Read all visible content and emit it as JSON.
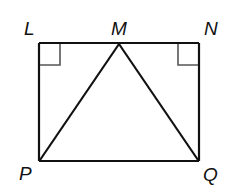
{
  "diagram": {
    "type": "geometry",
    "points": {
      "L": {
        "label": "L",
        "x": 39,
        "y": 43
      },
      "M": {
        "label": "M",
        "x": 119,
        "y": 43
      },
      "N": {
        "label": "N",
        "x": 199,
        "y": 43
      },
      "P": {
        "label": "P",
        "x": 39,
        "y": 161
      },
      "Q": {
        "label": "Q",
        "x": 199,
        "y": 161
      }
    },
    "segments": [
      "LN",
      "NQ",
      "QP",
      "PL",
      "MP",
      "MQ"
    ],
    "right_angles": [
      "L",
      "N"
    ],
    "colors": {
      "stroke": "#111111",
      "right_angle_mark": "#555555"
    }
  }
}
